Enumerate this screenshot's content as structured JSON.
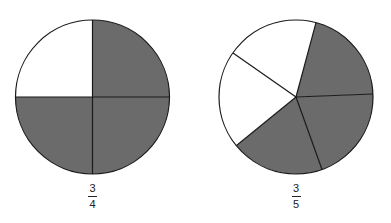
{
  "figures": [
    {
      "name": "three-quarters-circle",
      "numerator": "3",
      "denominator": "4",
      "parts": 4,
      "shaded": 3,
      "center": [
        92.5,
        97
      ],
      "radius": 77
    },
    {
      "name": "three-fifths-circle",
      "numerator": "3",
      "denominator": "5",
      "parts": 5,
      "shaded": 3,
      "center": [
        296,
        97
      ],
      "radius": 77
    }
  ],
  "colors": {
    "shade": "#6b6b6b",
    "unshaded": "#ffffff",
    "stroke": "#1a1a1a"
  }
}
